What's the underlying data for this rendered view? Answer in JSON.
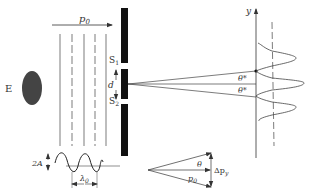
{
  "diagram": {
    "colors": {
      "ink": "#333333",
      "barrier": "#111111",
      "source": "#444444"
    },
    "source": {
      "label": "E"
    },
    "incident_beam": {
      "momentum_label": "p",
      "momentum_sub": "0"
    },
    "slits": {
      "s1_label": "S",
      "s1_sub": "1",
      "s2_label": "S",
      "s2_sub": "2",
      "separation_label": "d"
    },
    "angles": {
      "upper_label": "θ*",
      "lower_label": "θ*"
    },
    "screen": {
      "axis_label": "y"
    },
    "wave": {
      "amplitude_label": "2A",
      "wavelength_label": "λ",
      "wavelength_sub": "0"
    },
    "momentum_triangle": {
      "angle_label": "θ",
      "hyp_label": "p",
      "hyp_sub": "0",
      "delta_label": "Δp",
      "delta_sub": "y"
    }
  }
}
